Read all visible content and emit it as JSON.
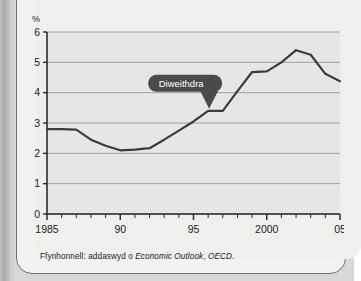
{
  "page": {
    "background_color": "#d8d8d6",
    "card_background_color": "#efefed",
    "edge_strip_color": "#a9a9a7"
  },
  "figure": {
    "unit_label": "%",
    "source_prefix": "Ffynhonnell: addaswyd o ",
    "source_publication": "Economic Outlook",
    "source_separator": ", ",
    "source_organisation": "OECD",
    "source_terminator": "."
  },
  "callout": {
    "label": "Diweithdra",
    "fill_color": "#4a4a4a",
    "text_color": "#ffffff",
    "anchor_year": 1996,
    "anchor_value": 3.4
  },
  "chart_data": {
    "type": "line",
    "title": "",
    "subtitle": "",
    "xlabel": "",
    "ylabel": "%",
    "xlim": [
      1985,
      2005
    ],
    "ylim": [
      0,
      6
    ],
    "grid": true,
    "grid_axis": "y",
    "legend_position": "none",
    "line_color": "#3c3c3c",
    "plot_background": "#e6e6e4",
    "y_ticks": [
      0,
      1,
      2,
      3,
      4,
      5,
      6
    ],
    "y_tick_labels": [
      "0",
      "1",
      "2",
      "3",
      "4",
      "5",
      "6"
    ],
    "x_ticks": [
      1985,
      1986,
      1987,
      1988,
      1989,
      1990,
      1991,
      1992,
      1993,
      1994,
      1995,
      1996,
      1997,
      1998,
      1999,
      2000,
      2001,
      2002,
      2003,
      2004,
      2005
    ],
    "x_labeled_ticks": [
      1985,
      1990,
      1995,
      2000,
      2005
    ],
    "x_tick_labels": [
      "1985",
      "90",
      "95",
      "2000",
      "05"
    ],
    "series": [
      {
        "name": "Diweithdra",
        "x": [
          1985,
          1986,
          1987,
          1988,
          1989,
          1990,
          1991,
          1992,
          1993,
          1994,
          1995,
          1996,
          1997,
          1998,
          1999,
          2000,
          2001,
          2002,
          2003,
          2004,
          2005
        ],
        "values": [
          2.8,
          2.8,
          2.78,
          2.45,
          2.25,
          2.1,
          2.12,
          2.17,
          2.45,
          2.75,
          3.05,
          3.4,
          3.4,
          4.05,
          4.68,
          4.7,
          5.0,
          5.4,
          5.25,
          4.62,
          4.38
        ]
      }
    ],
    "annotations": [
      {
        "text": "Diweithdra",
        "x": 1996,
        "y": 3.4,
        "style": "callout-pill"
      }
    ]
  }
}
